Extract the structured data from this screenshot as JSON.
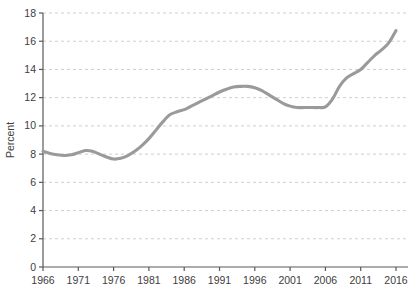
{
  "chart_data": {
    "type": "line",
    "title": "",
    "xlabel": "",
    "ylabel": "Percent",
    "xlim": [
      1966,
      2016
    ],
    "ylim": [
      0,
      18
    ],
    "y_ticks": [
      0,
      2,
      4,
      6,
      8,
      10,
      12,
      14,
      16,
      18
    ],
    "x_ticks": [
      1966,
      1971,
      1976,
      1981,
      1986,
      1991,
      1996,
      2001,
      2006,
      2011,
      2016
    ],
    "grid": "horizontal-dashed",
    "legend": "none",
    "line_color": "#9a9a9a",
    "axis_color": "#5a5a5a",
    "grid_color": "#cfcfcf",
    "text_color": "#3d3d3d",
    "series": [
      {
        "name": "Percent",
        "x": [
          1966,
          1967,
          1968,
          1969,
          1970,
          1971,
          1972,
          1973,
          1974,
          1975,
          1976,
          1977,
          1978,
          1979,
          1980,
          1981,
          1982,
          1983,
          1984,
          1985,
          1986,
          1987,
          1988,
          1989,
          1990,
          1991,
          1992,
          1993,
          1994,
          1995,
          1996,
          1997,
          1998,
          1999,
          2000,
          2001,
          2002,
          2003,
          2004,
          2005,
          2006,
          2007,
          2008,
          2009,
          2010,
          2011,
          2012,
          2013,
          2014,
          2015,
          2016
        ],
        "values": [
          8.2,
          8.05,
          7.95,
          7.9,
          7.95,
          8.1,
          8.25,
          8.2,
          8.0,
          7.8,
          7.65,
          7.7,
          7.9,
          8.2,
          8.6,
          9.1,
          9.7,
          10.3,
          10.8,
          11.0,
          11.15,
          11.4,
          11.65,
          11.9,
          12.15,
          12.4,
          12.6,
          12.75,
          12.8,
          12.8,
          12.7,
          12.5,
          12.2,
          11.9,
          11.6,
          11.4,
          11.3,
          11.3,
          11.3,
          11.3,
          11.35,
          11.9,
          12.8,
          13.4,
          13.7,
          14.0,
          14.5,
          15.0,
          15.4,
          15.9,
          16.75
        ]
      }
    ]
  },
  "axis": {
    "y_title": "Percent"
  }
}
